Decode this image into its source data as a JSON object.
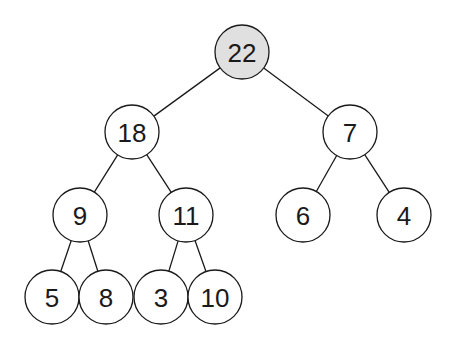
{
  "diagram": {
    "type": "binary-tree (max-heap)",
    "node_radius": 27,
    "colors": {
      "stroke": "#1a1a1a",
      "node_fill": "#ffffff",
      "highlight_fill": "#e0e0e0",
      "text": "#1a1a1a"
    },
    "nodes": [
      {
        "id": "n22",
        "label": "22",
        "x": 242,
        "y": 52,
        "highlighted": true
      },
      {
        "id": "n18",
        "label": "18",
        "x": 132,
        "y": 132,
        "highlighted": false
      },
      {
        "id": "n7",
        "label": "7",
        "x": 350,
        "y": 132,
        "highlighted": false
      },
      {
        "id": "n9",
        "label": "9",
        "x": 80,
        "y": 215,
        "highlighted": false
      },
      {
        "id": "n11",
        "label": "11",
        "x": 186,
        "y": 215,
        "highlighted": false
      },
      {
        "id": "n6",
        "label": "6",
        "x": 303,
        "y": 215,
        "highlighted": false
      },
      {
        "id": "n4",
        "label": "4",
        "x": 404,
        "y": 215,
        "highlighted": false
      },
      {
        "id": "n5",
        "label": "5",
        "x": 52,
        "y": 297,
        "highlighted": false
      },
      {
        "id": "n8",
        "label": "8",
        "x": 106,
        "y": 297,
        "highlighted": false
      },
      {
        "id": "n3",
        "label": "3",
        "x": 161,
        "y": 297,
        "highlighted": false
      },
      {
        "id": "n10",
        "label": "10",
        "x": 215,
        "y": 297,
        "highlighted": false
      }
    ],
    "edges": [
      {
        "from": "n22",
        "to": "n18"
      },
      {
        "from": "n22",
        "to": "n7"
      },
      {
        "from": "n18",
        "to": "n9"
      },
      {
        "from": "n18",
        "to": "n11"
      },
      {
        "from": "n7",
        "to": "n6"
      },
      {
        "from": "n7",
        "to": "n4"
      },
      {
        "from": "n9",
        "to": "n5"
      },
      {
        "from": "n9",
        "to": "n8"
      },
      {
        "from": "n11",
        "to": "n3"
      },
      {
        "from": "n11",
        "to": "n10"
      }
    ]
  }
}
